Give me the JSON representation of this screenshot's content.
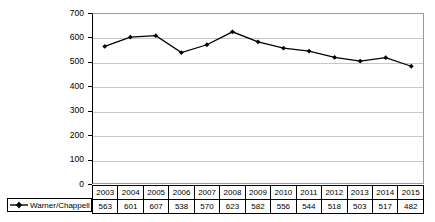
{
  "chart_data": {
    "type": "line",
    "title": "",
    "subtitle": "",
    "xlabel": "",
    "ylabel": "in million US$",
    "ylim": [
      0,
      700
    ],
    "ytick_step": 100,
    "yticks": [
      700,
      600,
      500,
      400,
      300,
      200,
      100,
      0
    ],
    "grid": true,
    "legend_position": "bottom-left",
    "categories": [
      "2003",
      "2004",
      "2005",
      "2006",
      "2007",
      "2008",
      "2009",
      "2010",
      "2011",
      "2012",
      "2013",
      "2014",
      "2015"
    ],
    "series": [
      {
        "name": "Warner/Chappell",
        "values": [
          563,
          601,
          607,
          538,
          570,
          623,
          582,
          556,
          544,
          518,
          503,
          517,
          482
        ],
        "color": "#000000",
        "marker": "diamond"
      }
    ]
  },
  "axis": {
    "y_title": "in million US$",
    "y_tick_labels": [
      "700",
      "600",
      "500",
      "400",
      "300",
      "200",
      "100",
      "0"
    ]
  },
  "legend": {
    "entries": [
      {
        "label": "Warner/Chappell",
        "marker_name": "line-diamond-marker"
      }
    ]
  },
  "data_table": {
    "header_row": [
      "2003",
      "2004",
      "2005",
      "2006",
      "2007",
      "2008",
      "2009",
      "2010",
      "2011",
      "2012",
      "2013",
      "2014",
      "2015"
    ],
    "value_row": [
      "563",
      "601",
      "607",
      "538",
      "570",
      "623",
      "582",
      "556",
      "544",
      "518",
      "503",
      "517",
      "482"
    ]
  },
  "colors": {
    "series": "#000000",
    "gridline": "#c8c8c8",
    "plot_border": "#9a9a9a",
    "axis": "#000000",
    "background": "#ffffff"
  }
}
